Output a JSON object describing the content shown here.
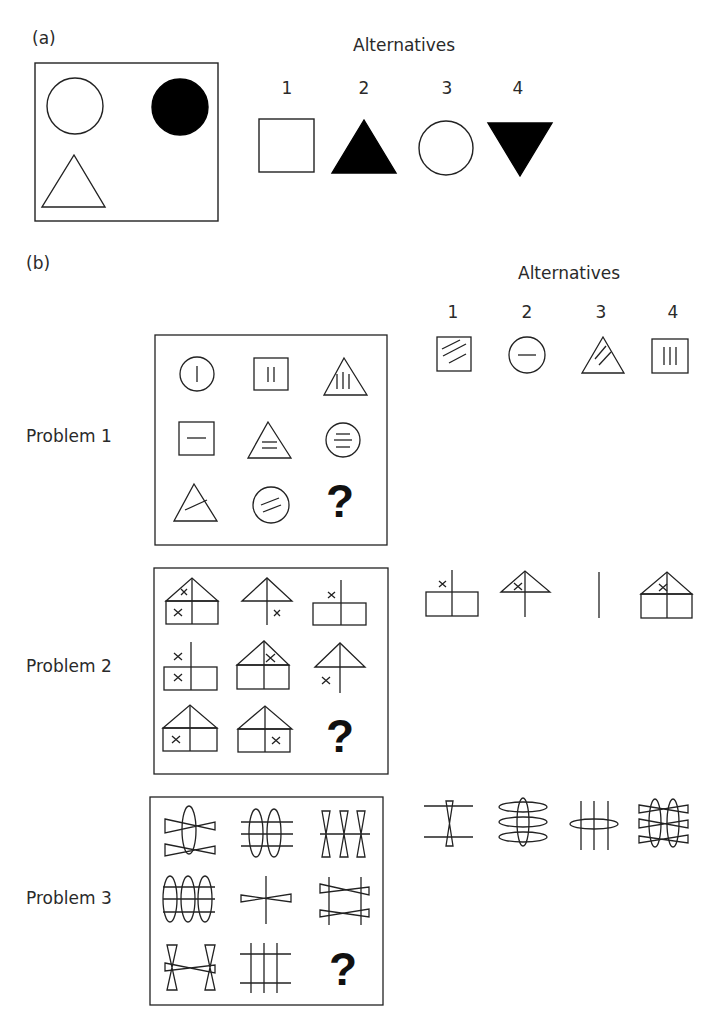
{
  "part_a": {
    "label": "(a)",
    "alternatives_heading": "Alternatives",
    "matrix": [
      "open-circle",
      "filled-circle",
      "open-triangle"
    ],
    "alternatives": [
      {
        "number": "1",
        "shape": "open-square"
      },
      {
        "number": "2",
        "shape": "filled-triangle"
      },
      {
        "number": "3",
        "shape": "open-circle"
      },
      {
        "number": "4",
        "shape": "filled-inverted-triangle"
      }
    ]
  },
  "part_b": {
    "label": "(b)",
    "alternatives_heading": "Alternatives",
    "alternative_numbers": [
      "1",
      "2",
      "3",
      "4"
    ],
    "problems": [
      {
        "label": "Problem 1",
        "missing_mark": "?",
        "cells": [
          "circle-1-vertical-line",
          "square-2-vertical-lines",
          "triangle-3-vertical-lines",
          "square-1-horizontal-line",
          "triangle-2-horizontal-lines",
          "circle-3-horizontal-lines",
          "triangle-1-diagonal-line",
          "circle-2-diagonal-lines",
          "?"
        ],
        "alternatives": [
          "square-3-diagonal-lines",
          "circle-1-horizontal-line",
          "triangle-2-diagonal-lines",
          "square-3-vertical-lines"
        ]
      },
      {
        "label": "Problem 2",
        "missing_mark": "?",
        "cells": [
          "house-x-roof-x-lower-left",
          "roof-pole-x-lower-right",
          "box-pole-x-upper-left",
          "box-pole-x-upper-left-x-lower-left",
          "house-x-roof",
          "roof-pole-x-lower-left",
          "house-x-lower-left",
          "house-x-lower-right",
          "?"
        ],
        "alternatives": [
          "box-pole-x-upper-left",
          "roof-pole-x-roof",
          "pole-only",
          "house-x-roof"
        ]
      },
      {
        "label": "Problem 3",
        "missing_mark": "?",
        "cells": [
          "1-ellipse-2-bowties",
          "2-ellipses-3-lines",
          "3-vertical-bowties-1-line",
          "3-ellipses-3-lines",
          "1-line-1-bowtie",
          "2-lines-2-bowties",
          "2-vertical-bowties-1-horizontal-bowtie",
          "3-vertical-lines-2-horizontal-lines",
          "?"
        ],
        "alternatives": [
          "1-vertical-bowtie-2-lines",
          "1-ellipse-3-horizontal-ellipses",
          "3-lines-1-horizontal-ellipse",
          "2-ellipses-3-bowties"
        ]
      }
    ]
  }
}
